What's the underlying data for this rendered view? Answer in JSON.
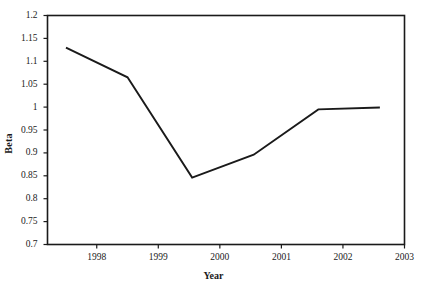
{
  "chart_data": {
    "type": "line",
    "title": "",
    "xlabel": "Year",
    "ylabel": "Beta",
    "xlim": [
      1997.2,
      2003.0
    ],
    "ylim": [
      0.7,
      1.2
    ],
    "grid": false,
    "legend": null,
    "xticks": [
      1998,
      1999,
      2000,
      2001,
      2002,
      2003
    ],
    "xtick_labels": [
      "1998",
      "1999",
      "2000",
      "2001",
      "2002",
      "2003"
    ],
    "yticks": [
      0.7,
      0.75,
      0.8,
      0.85,
      0.9,
      0.95,
      1,
      1.05,
      1.1,
      1.15,
      1.2
    ],
    "ytick_labels": [
      "0.7",
      "0.75",
      "0.8",
      "0.85",
      "0.9",
      "0.95",
      "1",
      "1.05",
      "1.1",
      "1.15",
      "1.2"
    ],
    "series": [
      {
        "name": "Beta",
        "color": "#1a1a1a",
        "x": [
          1997.5,
          1998.5,
          1999.55,
          2000.55,
          2001.6,
          2002.6
        ],
        "values": [
          1.13,
          1.065,
          0.846,
          0.896,
          0.995,
          0.999
        ]
      }
    ]
  },
  "figure": {
    "frame_color": "#1a1a1a",
    "background": "#ffffff",
    "line_color": "#1a1a1a"
  }
}
